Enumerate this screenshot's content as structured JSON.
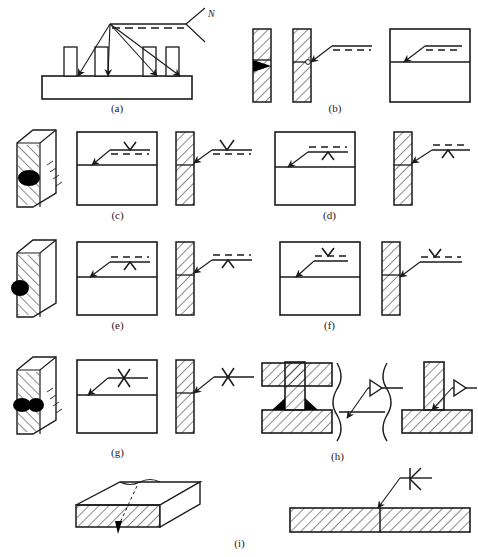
{
  "figure": {
    "width": 478,
    "height": 557,
    "background": "#ffffff",
    "line_color": "#1a1a1a",
    "fill_weld_color": "#000000",
    "panel_count": 9
  },
  "captions": [
    {
      "id": "a",
      "label": "(a)",
      "x": 117,
      "y": 108
    },
    {
      "id": "b",
      "label": "(b)",
      "x": 330,
      "y": 108
    },
    {
      "id": "c",
      "label": "(c)",
      "x": 117,
      "y": 215
    },
    {
      "id": "d",
      "label": "(d)",
      "x": 330,
      "y": 215
    },
    {
      "id": "e",
      "label": "(e)",
      "x": 117,
      "y": 325
    },
    {
      "id": "f",
      "label": "(f)",
      "x": 330,
      "y": 325
    },
    {
      "id": "g",
      "label": "(g)",
      "x": 117,
      "y": 452
    },
    {
      "id": "h",
      "label": "(h)",
      "x": 336,
      "y": 456
    },
    {
      "id": "i",
      "label": "(i)",
      "x": 239,
      "y": 543
    }
  ],
  "annotations": {
    "tail_letter": "N"
  },
  "panels": [
    {
      "id": "a",
      "name": "multi-arrow-common-weld",
      "description": "Base plate with four upright ribs, four leader arrows converging to one reference line with forked tail labelled N",
      "arrow_count": 4,
      "reference_line": {
        "solid": true,
        "dashed": true,
        "dashed_position": "below"
      },
      "tail": {
        "type": "fork",
        "letter": "N"
      },
      "weld_symbol": "none"
    },
    {
      "id": "b",
      "name": "fillet-no-symbol",
      "description": "Two hatched vertical sections: left with filled weld bead, right with plain reference line (no weld symbol)",
      "weld_symbol": "none",
      "reference_line": {
        "solid": true,
        "dashed": true,
        "dashed_position": "below"
      },
      "views": [
        "section-with-bead",
        "section-with-leader",
        "front-view-with-leader"
      ]
    },
    {
      "id": "c",
      "name": "v-groove-arrow-side",
      "description": "Isometric plate with bead, front view and side section, V symbol placed above solid reference line, dashed line below",
      "weld_symbol": "V",
      "symbol_position": "above-solid-line",
      "reference_line": {
        "solid": true,
        "dashed": true,
        "dashed_position": "below"
      }
    },
    {
      "id": "d",
      "name": "v-groove-other-side",
      "description": "Front view and side section, V symbol placed below solid reference line, dashed line above",
      "weld_symbol": "V",
      "symbol_position": "below-solid-line",
      "reference_line": {
        "solid": true,
        "dashed": true,
        "dashed_position": "above"
      }
    },
    {
      "id": "e",
      "name": "v-groove-other-side-iso",
      "description": "Isometric plate with bead on far side, V symbol below solid reference line, dashed line above",
      "weld_symbol": "V",
      "symbol_position": "below-solid-line",
      "reference_line": {
        "solid": true,
        "dashed": true,
        "dashed_position": "above"
      }
    },
    {
      "id": "f",
      "name": "v-groove-arrow-side-alt",
      "description": "Front view and side section, V symbol above solid reference line with dashed line below",
      "weld_symbol": "V",
      "symbol_position": "above-solid-line",
      "reference_line": {
        "solid": true,
        "dashed": true,
        "dashed_position": "below"
      }
    },
    {
      "id": "g",
      "name": "double-v-x-groove",
      "description": "Isometric plate welded both sides, X (double-V) symbol on a single solid reference line, no dashed line",
      "weld_symbol": "X",
      "symbol_position": "straddle-solid-line",
      "reference_line": {
        "solid": true,
        "dashed": false
      }
    },
    {
      "id": "h",
      "name": "fillet-t-joint",
      "description": "T-joint sections with fillet beads, triangle fillet symbol on solid reference line",
      "weld_symbol": "triangle-fillet",
      "symbol_position": "above-solid-line",
      "reference_line": {
        "solid": true,
        "dashed": false
      },
      "views": [
        "t-joint-with-beads",
        "broken-view-with-leader",
        "t-joint-with-leader"
      ]
    },
    {
      "id": "i",
      "name": "double-bevel-k-groove",
      "description": "Isometric plate with seam and sectioned plate view, K (double-bevel) symbol on solid reference line",
      "weld_symbol": "K",
      "symbol_position": "straddle-solid-line",
      "reference_line": {
        "solid": true,
        "dashed": false
      }
    }
  ]
}
